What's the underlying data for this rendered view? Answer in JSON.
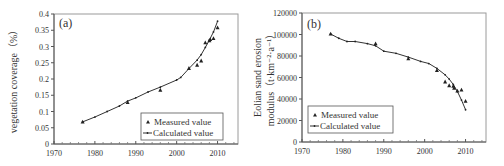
{
  "chart_data": [
    {
      "id": "a",
      "type": "line",
      "panel_label": "(a)",
      "title": "",
      "xlabel": "",
      "ylabel": "vegetation coverage（%）",
      "xlim": [
        1970,
        2015
      ],
      "ylim": [
        0,
        0.4
      ],
      "xticks": [
        1970,
        1980,
        1990,
        2000,
        2010
      ],
      "xtick_labels": [
        "1970",
        "1980",
        "1990",
        "2000",
        "2010"
      ],
      "yticks": [
        0,
        0.05,
        0.1,
        0.15,
        0.2,
        0.25,
        0.3,
        0.35,
        0.4
      ],
      "ytick_labels": [
        "0",
        "0.05",
        "0.1",
        "0.15",
        "0.2",
        "0.25",
        "0.3",
        "0.35",
        "0.4"
      ],
      "grid": false,
      "legend_position": "lower right",
      "series": [
        {
          "name": "Measured value",
          "style": "triangle-markers",
          "points": [
            [
              1977,
              0.068
            ],
            [
              1988,
              0.128
            ],
            [
              1996,
              0.166
            ],
            [
              2003,
              0.233
            ],
            [
              2005,
              0.243
            ],
            [
              2006,
              0.256
            ],
            [
              2007,
              0.312
            ],
            [
              2008,
              0.318
            ],
            [
              2008.2,
              0.322
            ],
            [
              2009,
              0.325
            ],
            [
              2010,
              0.358
            ]
          ]
        },
        {
          "name": "Calculated value",
          "style": "line-with-dots",
          "points": [
            [
              1977,
              0.068
            ],
            [
              1980,
              0.083
            ],
            [
              1983,
              0.1
            ],
            [
              1986,
              0.117
            ],
            [
              1988,
              0.132
            ],
            [
              1990,
              0.142
            ],
            [
              1993,
              0.16
            ],
            [
              1996,
              0.175
            ],
            [
              2000,
              0.197
            ],
            [
              2001,
              0.205
            ],
            [
              2003,
              0.232
            ],
            [
              2005,
              0.258
            ],
            [
              2006,
              0.275
            ],
            [
              2007,
              0.297
            ],
            [
              2008,
              0.32
            ],
            [
              2009,
              0.345
            ],
            [
              2010,
              0.378
            ]
          ]
        }
      ]
    },
    {
      "id": "b",
      "type": "line",
      "panel_label": "(b)",
      "title": "",
      "xlabel": "",
      "ylabel_line1": "Eolian sand erosion",
      "ylabel_line2": "modulus（t·km⁻²·a⁻¹）",
      "xlim": [
        1970,
        2015
      ],
      "ylim": [
        0,
        120000
      ],
      "xticks": [
        1970,
        1980,
        1990,
        2000,
        2010
      ],
      "xtick_labels": [
        "1970",
        "1980",
        "1990",
        "2000",
        "2010"
      ],
      "yticks": [
        0,
        20000,
        40000,
        60000,
        80000,
        100000,
        120000
      ],
      "ytick_labels": [
        "0",
        "20000",
        "40000",
        "60000",
        "80000",
        "100000",
        "120000"
      ],
      "grid": false,
      "legend_position": "lower left",
      "series": [
        {
          "name": "Measured value",
          "style": "triangle-markers",
          "points": [
            [
              1977,
              100500
            ],
            [
              1988,
              91500
            ],
            [
              1996,
              77500
            ],
            [
              2003,
              66500
            ],
            [
              2005,
              56000
            ],
            [
              2006,
              52500
            ],
            [
              2007,
              52000
            ],
            [
              2007.2,
              50000
            ],
            [
              2008,
              47500
            ],
            [
              2009,
              48500
            ],
            [
              2010,
              38000
            ]
          ]
        },
        {
          "name": "Calculated value",
          "style": "line-with-dots",
          "points": [
            [
              1977,
              100500
            ],
            [
              1979,
              96500
            ],
            [
              1981,
              93500
            ],
            [
              1983,
              93500
            ],
            [
              1986,
              91500
            ],
            [
              1988,
              89500
            ],
            [
              1990,
              84500
            ],
            [
              1993,
              82500
            ],
            [
              1996,
              79000
            ],
            [
              1999,
              75000
            ],
            [
              2001,
              73000
            ],
            [
              2003,
              68500
            ],
            [
              2005,
              62500
            ],
            [
              2006,
              58500
            ],
            [
              2007,
              53500
            ],
            [
              2008,
              47000
            ],
            [
              2009,
              39000
            ],
            [
              2010,
              30000
            ]
          ]
        }
      ]
    }
  ],
  "legend": {
    "measured_label": "Measured value",
    "calculated_label": "Calculated value"
  }
}
